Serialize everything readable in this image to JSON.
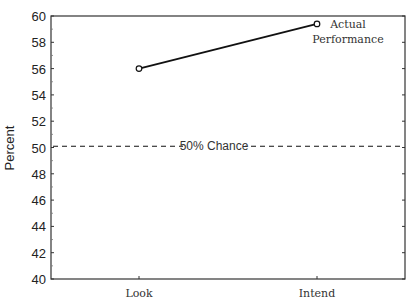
{
  "chart_data": {
    "type": "line",
    "title": "",
    "xlabel": "",
    "ylabel": "Percent",
    "categories": [
      "Look",
      "Intend"
    ],
    "series": [
      {
        "name": "Actual Performance",
        "values": [
          56.0,
          59.4
        ],
        "marker": "open-circle",
        "color": "#111111"
      }
    ],
    "reference_lines": [
      {
        "label": "50% Chance",
        "value": 50.1,
        "style": "dashed",
        "color": "#111111"
      }
    ],
    "ylim": [
      40,
      60
    ],
    "yticks": [
      40,
      42,
      44,
      46,
      48,
      50,
      52,
      54,
      56,
      58,
      60
    ],
    "grid": false,
    "legend": {
      "position": "inline-label-at-last-point"
    },
    "annotations": [
      {
        "text": "Actual",
        "at": "Intend"
      },
      {
        "text": "Performance",
        "at": "Intend"
      },
      {
        "text": "50% Chance",
        "at": "reference-line"
      }
    ]
  },
  "labels": {
    "ylabel": "Percent",
    "series_label_line1": "Actual",
    "series_label_line2": "Performance",
    "chance_label": "50% Chance",
    "cat_0": "Look",
    "cat_1": "Intend"
  }
}
